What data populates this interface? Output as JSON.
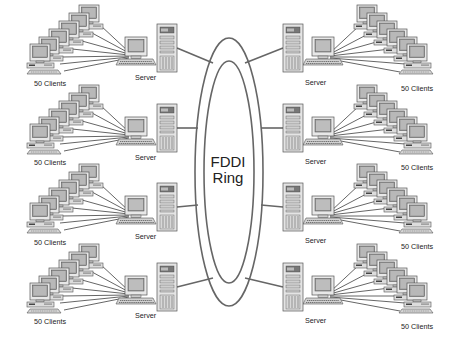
{
  "diagram": {
    "type": "FDDI ring network topology",
    "ring": {
      "label_line1": "FDDI",
      "label_line2": "Ring",
      "stroke_color": "#666666"
    },
    "left_segments": [
      {
        "server_label": "Server",
        "clients_label": "50 Clients"
      },
      {
        "server_label": "Server",
        "clients_label": "50 Clients"
      },
      {
        "server_label": "Server",
        "clients_label": "50 Clients"
      },
      {
        "server_label": "Server",
        "clients_label": "50 Clients"
      }
    ],
    "right_segments": [
      {
        "server_label": "Server",
        "clients_label": "50 Clients"
      },
      {
        "server_label": "Server",
        "clients_label": "50 Clients"
      },
      {
        "server_label": "Server",
        "clients_label": "50 Clients"
      },
      {
        "server_label": "Server",
        "clients_label": "50 Clients"
      }
    ],
    "colors": {
      "line": "#555555",
      "device_fill": "#e6e6e6",
      "device_dark": "#777777",
      "screen": "#999999"
    }
  }
}
